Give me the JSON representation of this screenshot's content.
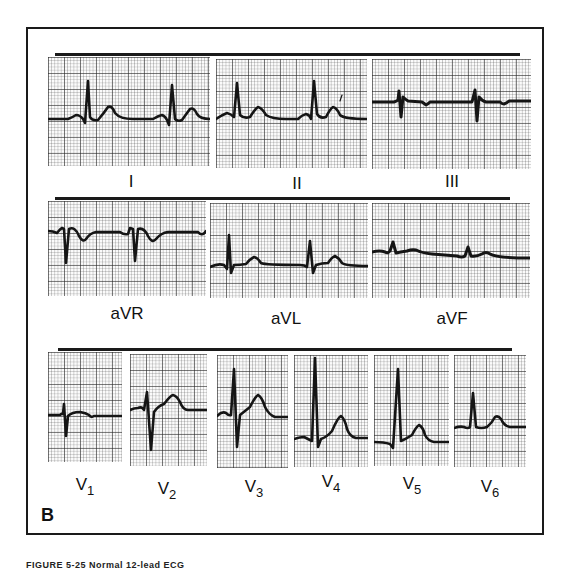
{
  "figure": {
    "panel_letter": "B",
    "caption_partial": "FIGURE 5-25  Normal 12-lead ECG",
    "grid": {
      "major_px": 16,
      "minor_px": 3.2
    }
  },
  "rows": [
    {
      "name": "limb-leads",
      "leads": [
        {
          "label": "I",
          "sub": ""
        },
        {
          "label": "II",
          "sub": ""
        },
        {
          "label": "III",
          "sub": ""
        }
      ]
    },
    {
      "name": "augmented-leads",
      "leads": [
        {
          "label": "aVR",
          "sub": ""
        },
        {
          "label": "aVL",
          "sub": ""
        },
        {
          "label": "aVF",
          "sub": ""
        }
      ]
    },
    {
      "name": "precordial-leads",
      "leads": [
        {
          "label": "V",
          "sub": "1"
        },
        {
          "label": "V",
          "sub": "2"
        },
        {
          "label": "V",
          "sub": "3"
        },
        {
          "label": "V",
          "sub": "4"
        },
        {
          "label": "V",
          "sub": "5"
        },
        {
          "label": "V",
          "sub": "6"
        }
      ]
    }
  ],
  "colors": {
    "ink": "#151515",
    "paper": "#fbfbfb",
    "frame": "#1a1a1a"
  }
}
